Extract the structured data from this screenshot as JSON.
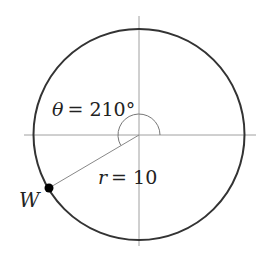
{
  "diagram": {
    "type": "unit-circle-angle",
    "center": {
      "x": 139,
      "y": 135
    },
    "radius_px": 106,
    "angle_label": "θ = 210°",
    "angle_symbol": "θ",
    "angle_value": "= 210°",
    "radius_label_var": "r",
    "radius_label_value": "= 10",
    "point_label": "W",
    "angle_degrees": 210,
    "radius_value": 10,
    "colors": {
      "circle": "#333333",
      "axes": "#999999",
      "radius_line": "#888888",
      "arc": "#777777",
      "point": "#000000"
    }
  }
}
